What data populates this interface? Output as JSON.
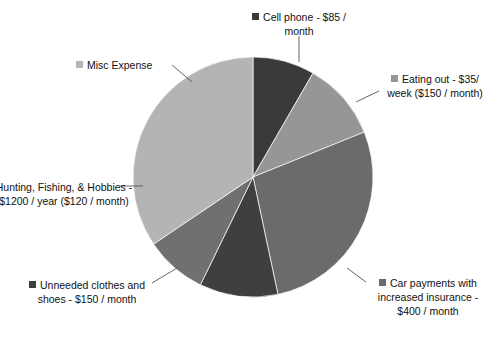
{
  "chart_data": {
    "type": "pie",
    "title": "",
    "subtitle": "",
    "xlabel": "",
    "ylabel": "",
    "grid": false,
    "legend_position": "outside-callout-labels",
    "start_angle_deg": 0,
    "direction": "clockwise",
    "center": {
      "x": 253,
      "y": 177,
      "radius": 120
    },
    "categories": [
      "Cell phone - $85 / month",
      "Eating out - $35/ week ($150 / month)",
      "Car payments with increased insurance - $400 / month",
      "Unneeded clothes and shoes - $150 / month",
      "Hunting, Fishing, & Hobbies - $1200 / year ($120 / month)",
      "Misc Expense"
    ],
    "values": [
      85,
      150,
      400,
      150,
      120,
      400
    ],
    "units": "dollars per month",
    "slices": [
      {
        "label": "Cell phone - $85 / month",
        "label_lines": [
          "Cell phone - $85 /",
          "month"
        ],
        "short_name": "Cell phone",
        "amount": 85,
        "amount_text": "$85 / month",
        "color": "#3a3a3a",
        "start_deg": 0,
        "end_deg": 30,
        "sweep_deg": 30,
        "percent": 8.3,
        "has_marker": true,
        "clipped": false
      },
      {
        "label": "Eating out - $35/ week ($150 / month)",
        "label_lines": [
          "Eating out - $35/",
          "week ($150 /",
          "month)"
        ],
        "short_name": "Eating out",
        "amount": 150,
        "amount_text": "$35/ week ($150 / month)",
        "color": "#969696",
        "start_deg": 30,
        "end_deg": 68,
        "sweep_deg": 38,
        "percent": 11.1,
        "has_marker": true,
        "clipped": true
      },
      {
        "label": "Car payments with increased insurance - $400 / month",
        "label_lines": [
          "Car payments with",
          "increased insurance",
          "- $400 / month"
        ],
        "short_name": "Car payments",
        "amount": 400,
        "amount_text": "$400 / month",
        "color": "#6b6b6b",
        "start_deg": 68,
        "end_deg": 168,
        "sweep_deg": 100,
        "percent": 29.6,
        "has_marker": true,
        "clipped": true
      },
      {
        "label": "Unneeded clothes and shoes - $150 / month",
        "label_lines": [
          "Unneeded clothes",
          "and shoes - $150 /",
          "month"
        ],
        "short_name": "Unneeded clothes and shoes",
        "amount": 150,
        "amount_text": "$150 / month",
        "color": "#3f3f3f",
        "start_deg": 168,
        "end_deg": 206,
        "sweep_deg": 38,
        "percent": 11.1,
        "has_marker": true,
        "clipped": false
      },
      {
        "label": "Hunting, Fishing, & Hobbies - $1200 / year ($120 / month)",
        "label_lines": [
          "Hunting, Fishing, &",
          "Hobbies - $1200 /",
          "year ($120 / month)"
        ],
        "short_name": "Hunting, Fishing, & Hobbies",
        "amount": 120,
        "amount_text": "$1200 / year ($120 / month)",
        "color": "#707070",
        "start_deg": 206,
        "end_deg": 236,
        "sweep_deg": 30,
        "percent": 8.9,
        "has_marker": false,
        "clipped": true
      },
      {
        "label": "Misc Expense",
        "label_lines": [
          "Misc Expense"
        ],
        "short_name": "Misc Expense",
        "amount": 400,
        "amount_text": "",
        "color": "#b4b4b4",
        "start_deg": 236,
        "end_deg": 360,
        "sweep_deg": 124,
        "percent": 31.0,
        "has_marker": true,
        "clipped": false
      }
    ],
    "colors": [
      "#3a3a3a",
      "#969696",
      "#6b6b6b",
      "#3f3f3f",
      "#707070",
      "#b4b4b4"
    ],
    "background": "#ffffff",
    "leader_line_color": "#555555"
  }
}
